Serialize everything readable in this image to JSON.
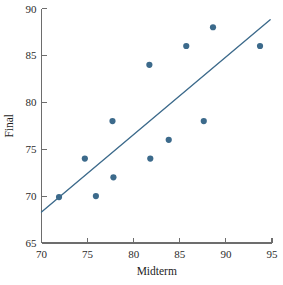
{
  "chart_data": {
    "type": "scatter",
    "title": "",
    "xlabel": "Midterm",
    "ylabel": "Final",
    "xlim": [
      70,
      95
    ],
    "ylim": [
      65,
      90
    ],
    "xticks": [
      70,
      75,
      80,
      85,
      90,
      95
    ],
    "yticks": [
      65,
      70,
      75,
      80,
      85,
      90
    ],
    "xtick_labels": [
      "70",
      "75",
      "80",
      "85",
      "90",
      "95"
    ],
    "ytick_labels": [
      "65",
      "70",
      "75",
      "80",
      "85",
      "90"
    ],
    "grid": false,
    "legend": null,
    "point_color": "#3c6a8b",
    "line_color": "#3c6a8b",
    "axis_color": "#6d6d6d",
    "point_radius": 3.1,
    "points": [
      {
        "x": 71.9,
        "y": 69.9
      },
      {
        "x": 74.7,
        "y": 74.0
      },
      {
        "x": 75.9,
        "y": 70.0
      },
      {
        "x": 77.7,
        "y": 78.0
      },
      {
        "x": 77.8,
        "y": 72.0
      },
      {
        "x": 81.7,
        "y": 84.0
      },
      {
        "x": 81.8,
        "y": 74.0
      },
      {
        "x": 83.8,
        "y": 76.0
      },
      {
        "x": 85.7,
        "y": 86.0
      },
      {
        "x": 87.6,
        "y": 78.0
      },
      {
        "x": 88.6,
        "y": 88.0
      },
      {
        "x": 93.7,
        "y": 86.0
      }
    ],
    "fit_line": {
      "name": "least-squares regression line",
      "x_start": 70.0,
      "y_start": 68.3,
      "x_end": 94.8,
      "y_end": 88.8
    }
  }
}
